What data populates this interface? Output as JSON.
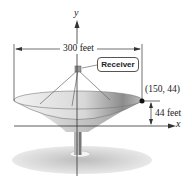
{
  "figure": {
    "type": "parabolic-dish-diagram",
    "axes": {
      "x_label": "x",
      "y_label": "y"
    },
    "labels": {
      "width": "300 feet",
      "receiver": "Receiver",
      "point": "(150, 44)",
      "depth": "44 feet"
    },
    "point": {
      "x": 150,
      "y": 44
    },
    "colors": {
      "line": "#333333",
      "dish_light": "#e6e6e6",
      "dish_dark": "#8a8a8a",
      "ground": "#c8c8c8"
    }
  }
}
